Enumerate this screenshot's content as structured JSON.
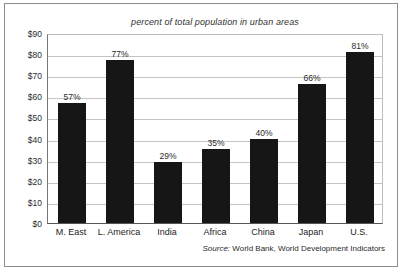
{
  "chart_data": {
    "type": "bar",
    "title": "percent of total population in urban areas",
    "xlabel": "",
    "ylabel": "",
    "ylim": [
      0,
      90
    ],
    "grid": true,
    "legend": false,
    "categories": [
      "M. East",
      "L. America",
      "India",
      "Africa",
      "China",
      "Japan",
      "U.S."
    ],
    "values": [
      57,
      77,
      29,
      35,
      40,
      66,
      81
    ],
    "data_labels": [
      "57%",
      "77%",
      "29%",
      "35%",
      "40%",
      "66%",
      "81%"
    ],
    "ytick_labels": [
      "$90",
      "$80",
      "$70",
      "$60",
      "$50",
      "$40",
      "$30",
      "$20",
      "$10",
      "$0"
    ],
    "ytick_values": [
      90,
      80,
      70,
      60,
      50,
      40,
      30,
      20,
      10,
      0
    ],
    "bar_color": "#161616",
    "gridline_color": "#c4c4c4",
    "annotations": [
      "Source: World Bank, World Development Indicators"
    ]
  },
  "source": {
    "prefix": "Source:",
    "text": "World Bank, World Development Indicators"
  }
}
